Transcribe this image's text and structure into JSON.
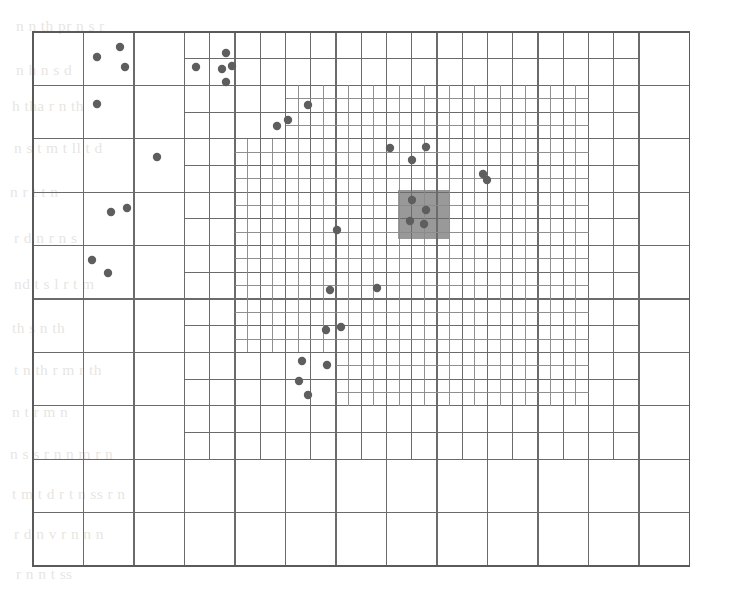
{
  "figure": {
    "type": "adaptive-grid-diagram",
    "canvas": {
      "width": 742,
      "height": 593
    },
    "plot_area": {
      "x": 33,
      "y": 32,
      "width": 676,
      "height": 534
    },
    "colors": {
      "background": "#ffffff",
      "grid_line": "#6b6b6b",
      "grid_line_fine": "#8a8a8a",
      "border": "#5a5a5a",
      "point_fill": "#5e5e5e",
      "highlight_cell": "#999999",
      "bleed_text": "#8a8072"
    },
    "base_grid": {
      "columns": 13,
      "rows": 10,
      "cell_width": 50.5,
      "cell_height": 53.4
    },
    "refinement_levels": 3,
    "point_radius": 4.2,
    "highlight_cell": {
      "x": 398,
      "y": 190,
      "width": 51,
      "height": 49
    },
    "point_count": 32,
    "points": [
      [
        97,
        57
      ],
      [
        120,
        47
      ],
      [
        125,
        67
      ],
      [
        97,
        104
      ],
      [
        157,
        157
      ],
      [
        111,
        212
      ],
      [
        127,
        208
      ],
      [
        92,
        260
      ],
      [
        108,
        273
      ],
      [
        196,
        67
      ],
      [
        226,
        53
      ],
      [
        222,
        69
      ],
      [
        232,
        66
      ],
      [
        226,
        82
      ],
      [
        308,
        105
      ],
      [
        277,
        126
      ],
      [
        288,
        120
      ],
      [
        390,
        148
      ],
      [
        426,
        147
      ],
      [
        412,
        160
      ],
      [
        483,
        174
      ],
      [
        487,
        180
      ],
      [
        337,
        230
      ],
      [
        330,
        290
      ],
      [
        377,
        288
      ],
      [
        326,
        330
      ],
      [
        341,
        327
      ],
      [
        302,
        361
      ],
      [
        327,
        365
      ],
      [
        299,
        381
      ],
      [
        308,
        395
      ],
      [
        412,
        200
      ],
      [
        426,
        210
      ],
      [
        410,
        221
      ],
      [
        424,
        224
      ]
    ],
    "highlighted_points": [
      [
        412,
        200
      ],
      [
        426,
        210
      ],
      [
        410,
        221
      ],
      [
        424,
        224
      ]
    ]
  },
  "bleed_text": {
    "note": "Faint scanned page bleed-through visible behind the figure",
    "lines": [
      {
        "x": 16,
        "y": 18,
        "text": "n   n  th   pr     n                        s   r"
      },
      {
        "x": 16,
        "y": 62,
        "text": "n   h  n  s d"
      },
      {
        "x": 12,
        "y": 98,
        "text": "h  tha     r         n  th"
      },
      {
        "x": 14,
        "y": 140,
        "text": "n  s t   m      t   ll   t      d"
      },
      {
        "x": 10,
        "y": 184,
        "text": "n      r      t    t   n"
      },
      {
        "x": 14,
        "y": 230,
        "text": "r   d  n        r   n       s"
      },
      {
        "x": 14,
        "y": 276,
        "text": "nd   t   s    l   r   t     m"
      },
      {
        "x": 12,
        "y": 320,
        "text": "th  s                n    th"
      },
      {
        "x": 14,
        "y": 362,
        "text": "t  n   th   r    m   r    th"
      },
      {
        "x": 12,
        "y": 404,
        "text": "n      t        r     m    n"
      },
      {
        "x": 10,
        "y": 446,
        "text": "n   s       s         r   n  n    m     r    n"
      },
      {
        "x": 12,
        "y": 486,
        "text": "t   m   t   d   r         t      n   ss     r   n"
      },
      {
        "x": 14,
        "y": 526,
        "text": "r    d   n           v   r   n     n   n"
      },
      {
        "x": 16,
        "y": 566,
        "text": "r             n   n           t    ss"
      }
    ]
  }
}
